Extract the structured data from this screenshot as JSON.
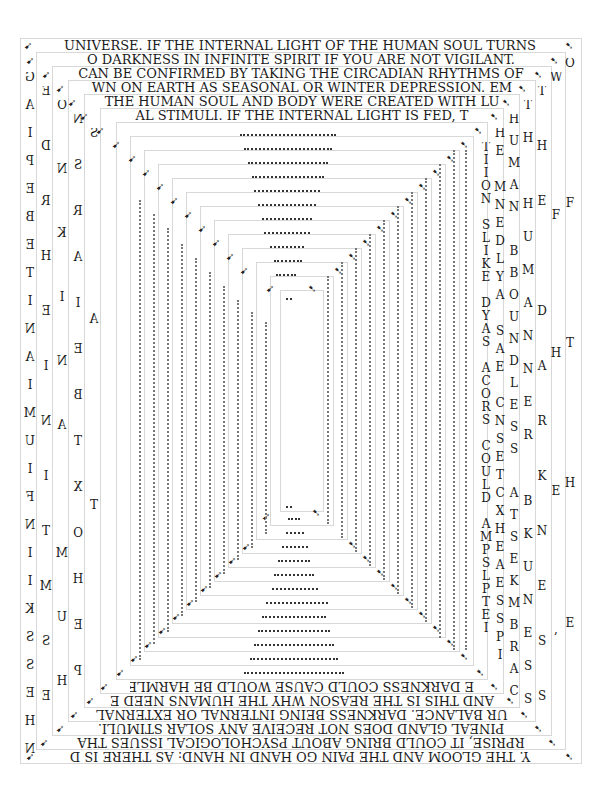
{
  "artwork": {
    "background": "#ffffff",
    "ink": "#1a1a1a",
    "frame_color": "#d8d8d8",
    "top_lines": [
      "UNIVERSE. IF THE INTERNAL LIGHT OF THE HUMAN SOUL TURNS",
      "O DARKNESS IN INFINITE SPIRIT IF YOU ARE NOT VIGILANT.",
      "CAN BE CONFIRMED BY TAKING THE CIRCADIAN RHYTHMS OF",
      "WN ON EARTH AS SEASONAL OR WINTER DEPRESSION. EM",
      "THE HUMAN SOUL AND BODY WERE CREATED WITH LU",
      "AL STIMULI. IF THE INTERNAL LIGHT IS FED, T"
    ],
    "bottom_lines_mirrored": [
      "E DARKNESS COULD CAUSE WOULD BE HARMLES",
      "AND THIS IS THE REASON WHY THE HUMANS NEED E",
      "UR BALANCE. DARKNESS BEING INTERNAL OR EXTERNAL",
      "PINEAL GLAND DOES NOT RECEIVE ANY SOLAR STIMULI.",
      "RPRISE, IT COULD BRING ABOUT PSYCHOLOGICAL ISSUES THA",
      "Y. THE GLOOM AND THE PAIN GO HAND IN HAND: AS THERE IS D"
    ],
    "right_columns": [
      "OFTHE",
      "WFHE,",
      "THE DARKNESS",
      "TH HUMANNER BKUNESS",
      "HUMAN BBOUNDLESS ATSEKMBRAC",
      "HE MNEDLYA SAE CNSETCXHEAESSPI",
      "TIION SLIKE DYAS ACORS COULD AMPSLPTEI",
      "MHIE ON PUSHYSF IIKOBE LEORF GSE"
    ],
    "left_columns_mirrored": [
      "SLAT",
      "SAT",
      "ONKINA MUH",
      "NSRAIEBTXOHEP",
      "EDRHEINITMSE",
      "GAIPEBETINAIMUIFNIIKSSEHN"
    ],
    "cursor_glyph": "➷",
    "cursor_glyph_mirror": "➹"
  }
}
